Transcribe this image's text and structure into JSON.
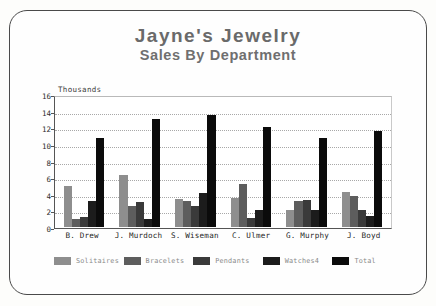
{
  "chart_data": {
    "type": "bar",
    "title": "Jayne's Jewelry",
    "subtitle": "Sales By Department",
    "xlabel": "",
    "ylabel": "Thousands",
    "ylim": [
      0,
      16
    ],
    "ytick_step": 2,
    "yticks": [
      16,
      14,
      12,
      10,
      8,
      6,
      4,
      2,
      0
    ],
    "grid": true,
    "legend_position": "bottom",
    "categories": [
      "B. Drew",
      "J. Murdoch",
      "S. Wiseman",
      "C. Ulmer",
      "G. Murphy",
      "J. Boyd"
    ],
    "series": [
      {
        "name": "Solitaires",
        "color": "#8e8e8e",
        "values": [
          5.0,
          6.3,
          3.4,
          3.5,
          2.1,
          4.3
        ]
      },
      {
        "name": "Bracelets",
        "color": "#5d5d5d",
        "values": [
          1.0,
          2.6,
          3.2,
          5.2,
          3.1,
          3.8
        ]
      },
      {
        "name": "Pendants",
        "color": "#3a3a3a",
        "values": [
          1.2,
          3.0,
          2.6,
          1.1,
          3.3,
          2.1
        ]
      },
      {
        "name": "Watches4",
        "color": "#1c1c1c",
        "values": [
          3.2,
          1.0,
          4.1,
          2.1,
          2.1,
          1.3
        ]
      },
      {
        "name": "Total",
        "color": "#0b0b0b",
        "values": [
          10.9,
          13.2,
          13.6,
          12.2,
          10.9,
          11.7
        ]
      }
    ]
  }
}
